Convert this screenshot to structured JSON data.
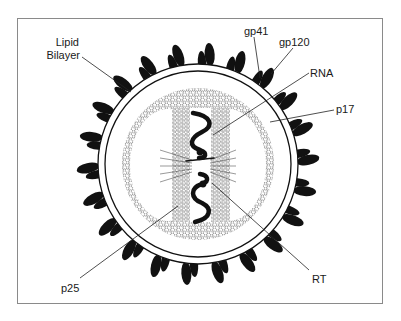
{
  "figure": {
    "labels": {
      "lipid_bilayer_line1": "Lipid",
      "lipid_bilayer_line2": "Bilayer",
      "gp41": "gp41",
      "gp120": "gp120",
      "rna": "RNA",
      "p17": "p17",
      "p25": "p25",
      "rt": "RT"
    },
    "colors": {
      "ink": "#111111",
      "frame": "#8a8a8a",
      "background": "#ffffff",
      "hex_stroke": "#444444"
    },
    "structure": {
      "center": [
        198,
        164
      ],
      "membrane_outer_radius": 100,
      "membrane_inner_radius": 93,
      "capsid_outer_radius": 76,
      "spike_count": 22
    }
  }
}
